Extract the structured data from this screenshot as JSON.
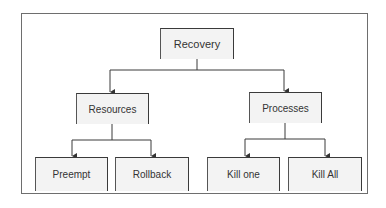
{
  "diagram": {
    "root": {
      "label": "Recovery"
    },
    "branches": [
      {
        "label": "Resources",
        "children": [
          {
            "label": "Preempt"
          },
          {
            "label": "Rollback"
          }
        ]
      },
      {
        "label": "Processes",
        "children": [
          {
            "label": "Kill one"
          },
          {
            "label": "Kill All"
          }
        ]
      }
    ]
  },
  "colors": {
    "line": "#3a3a3a",
    "node_fill": "#f3f3f3",
    "frame": "#6e6e6e"
  }
}
